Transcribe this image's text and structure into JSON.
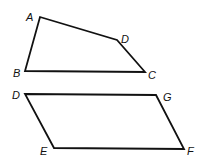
{
  "figures": [
    {
      "name": "quadrilateral-ABCD",
      "vertices": [
        {
          "label": "A",
          "x": 40,
          "y": 17,
          "lx": 26,
          "ly": 21
        },
        {
          "label": "D",
          "x": 117,
          "y": 40,
          "lx": 121,
          "ly": 43
        },
        {
          "label": "C",
          "x": 145,
          "y": 72,
          "lx": 148,
          "ly": 79
        },
        {
          "label": "B",
          "x": 25,
          "y": 71,
          "lx": 13,
          "ly": 77
        }
      ]
    },
    {
      "name": "parallelogram-DEFG",
      "vertices": [
        {
          "label": "D",
          "x": 25,
          "y": 94,
          "lx": 12,
          "ly": 99
        },
        {
          "label": "G",
          "x": 156,
          "y": 95,
          "lx": 163,
          "ly": 101
        },
        {
          "label": "F",
          "x": 184,
          "y": 149,
          "lx": 187,
          "ly": 155
        },
        {
          "label": "E",
          "x": 54,
          "y": 148,
          "lx": 40,
          "ly": 155
        }
      ]
    }
  ]
}
